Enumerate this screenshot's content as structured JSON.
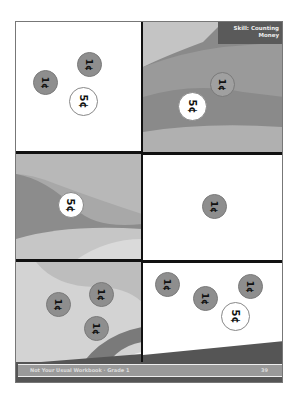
{
  "header": {
    "skill_line1": "Skill: Counting",
    "skill_line2": "Money"
  },
  "panels": [
    {
      "coins": [
        "1¢",
        "1¢",
        "5¢"
      ]
    },
    {
      "coins": [
        "1¢",
        "5¢"
      ]
    },
    {
      "coins": [
        "5¢"
      ]
    },
    {
      "coins": [
        "1¢"
      ]
    },
    {
      "coins": [
        "1¢",
        "1¢",
        "1¢"
      ]
    },
    {
      "coins": [
        "1¢",
        "1¢",
        "1¢",
        "5¢"
      ]
    }
  ],
  "footer": {
    "title": "Not Your Usual Workbook · Grade 1",
    "page_number": "39"
  },
  "colors": {
    "penny": "#8e8e8e",
    "nickel": "#ffffff",
    "divider": "#111111"
  }
}
